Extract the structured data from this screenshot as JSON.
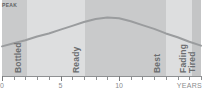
{
  "chart_data": {
    "type": "area",
    "title": "",
    "xlabel": "YEARS",
    "ylabel": "",
    "xlim": [
      0,
      17
    ],
    "ylim": [
      0,
      1
    ],
    "grid": false,
    "legend": "none",
    "peak_label": "PEAK",
    "axis_ticks": [
      {
        "value": 0,
        "label": "0"
      },
      {
        "value": 1,
        "label": ""
      },
      {
        "value": 2,
        "label": ""
      },
      {
        "value": 3,
        "label": ""
      },
      {
        "value": 4,
        "label": ""
      },
      {
        "value": 5,
        "label": "5"
      },
      {
        "value": 6,
        "label": ""
      },
      {
        "value": 7,
        "label": ""
      },
      {
        "value": 8,
        "label": ""
      },
      {
        "value": 9,
        "label": ""
      },
      {
        "value": 10,
        "label": "10"
      },
      {
        "value": 11,
        "label": ""
      },
      {
        "value": 12,
        "label": ""
      },
      {
        "value": 13,
        "label": ""
      },
      {
        "value": 14,
        "label": ""
      },
      {
        "value": 15,
        "label": ""
      },
      {
        "value": 16,
        "label": ""
      },
      {
        "value": 17,
        "label": ""
      }
    ],
    "bands": [
      {
        "label": "Bottled",
        "x_start": 0,
        "x_end": 2.1,
        "color": "#c9cacb"
      },
      {
        "label": "Ready",
        "x_start": 2.1,
        "x_end": 7.1,
        "color": "#dddedf"
      },
      {
        "label": "Best",
        "x_start": 7.1,
        "x_end": 14.0,
        "color": "#c9cacb"
      },
      {
        "label": "Fading",
        "x_start": 14.0,
        "x_end": 16.2,
        "color": "#dddedf"
      },
      {
        "label": "Tired",
        "x_start": 16.2,
        "x_end": 17.0,
        "color": "#c4c5c6"
      }
    ],
    "curve": {
      "name": "Drinkability",
      "color": "#9a9c9e",
      "x": [
        0,
        1,
        2,
        3,
        4,
        5,
        6,
        7,
        8,
        9,
        10,
        11,
        12,
        13,
        14,
        15,
        16,
        17
      ],
      "y": [
        0.39,
        0.43,
        0.47,
        0.52,
        0.56,
        0.61,
        0.66,
        0.71,
        0.75,
        0.77,
        0.76,
        0.72,
        0.67,
        0.62,
        0.56,
        0.51,
        0.45,
        0.4
      ],
      "peak_x": 9
    }
  },
  "colors": {
    "background": "#ffffff",
    "band_dark": "#c9cacb",
    "band_light": "#dddedf",
    "curve": "#9a9c9e",
    "axis": "#8e9092",
    "text": "#6b6d6f"
  }
}
